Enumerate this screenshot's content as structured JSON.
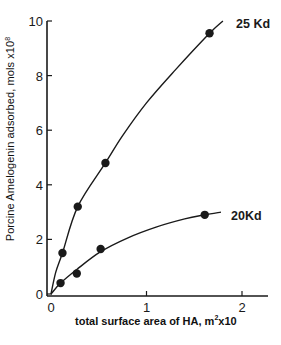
{
  "chart_data": {
    "type": "scatter",
    "title": "",
    "xlabel": "total surface area of HA,  m²x10",
    "ylabel": "Porcine Amelogenin adsorbed,  mols  x10⁸",
    "xlim": [
      0,
      2.3
    ],
    "ylim": [
      0,
      10
    ],
    "x_ticks": [
      "0",
      "1",
      "2"
    ],
    "y_ticks": [
      "0",
      "2",
      "4",
      "6",
      "8",
      "10"
    ],
    "grid": false,
    "legend": "inline curve labels at right",
    "series": [
      {
        "name": "25 Kd",
        "points": [
          {
            "x": 0.12,
            "y": 1.5
          },
          {
            "x": 0.28,
            "y": 3.2
          },
          {
            "x": 0.57,
            "y": 4.8
          },
          {
            "x": 1.66,
            "y": 9.55
          }
        ],
        "fit_curve": [
          [
            0,
            0
          ],
          [
            0.05,
            0.8
          ],
          [
            0.12,
            1.5
          ],
          [
            0.28,
            3.2
          ],
          [
            0.57,
            4.8
          ],
          [
            0.75,
            5.8
          ],
          [
            1.0,
            7.0
          ],
          [
            1.3,
            8.2
          ],
          [
            1.66,
            9.55
          ],
          [
            1.8,
            10.0
          ]
        ]
      },
      {
        "name": "20Kd",
        "points": [
          {
            "x": 0.1,
            "y": 0.4
          },
          {
            "x": 0.27,
            "y": 0.75
          },
          {
            "x": 0.52,
            "y": 1.65
          },
          {
            "x": 1.61,
            "y": 2.9
          }
        ],
        "fit_curve": [
          [
            0,
            0
          ],
          [
            0.1,
            0.4
          ],
          [
            0.27,
            0.9
          ],
          [
            0.52,
            1.55
          ],
          [
            0.8,
            2.05
          ],
          [
            1.1,
            2.45
          ],
          [
            1.4,
            2.75
          ],
          [
            1.61,
            2.9
          ],
          [
            1.78,
            3.0
          ]
        ]
      }
    ]
  },
  "labels": {
    "series_25": "25 Kd",
    "series_20": "20Kd",
    "ylabel_main": "Porcine Amelogenin adsorbed,  mols  x10",
    "ylabel_exp": "8",
    "xlabel_main": "total surface area of HA,  m",
    "xlabel_sup": "2",
    "xlabel_tail": "x10"
  }
}
